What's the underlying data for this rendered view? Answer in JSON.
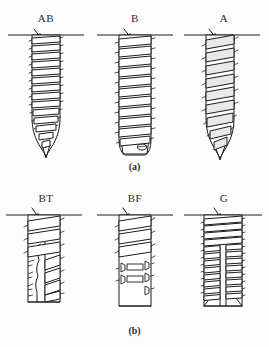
{
  "figure": {
    "title_alt": "Screw thread form comparison figure",
    "background_color": "#fdfdfd",
    "line_color": "#1c1c1c",
    "panels": [
      {
        "caption": "(a)",
        "items": [
          {
            "label": "AB",
            "name": "screw-ab",
            "description": "Tapered point self-tapping screw, type AB thread, narrow pitch",
            "thread_turns": 13,
            "tip": "pointed",
            "shank": "tapered"
          },
          {
            "label": "B",
            "name": "screw-b",
            "description": "Blunt point type B thread, wide crest, parallel shank",
            "thread_turns": 11,
            "tip": "blunt-flat",
            "shank": "parallel"
          },
          {
            "label": "A",
            "name": "screw-a",
            "description": "Coarse pitch type A thread with sharp gimlet point",
            "thread_turns": 9,
            "tip": "pointed",
            "shank": "tapered"
          }
        ]
      },
      {
        "caption": "(b)",
        "items": [
          {
            "label": "BT",
            "name": "screw-bt",
            "description": "Type BT thread with longitudinal cutting slot along shank",
            "thread_turns": 7,
            "tip": "flat",
            "shank": "parallel-slotted"
          },
          {
            "label": "BF",
            "name": "screw-bf",
            "description": "Type BF thread with rectangular cutting flutes on lower shank",
            "thread_turns": 6,
            "tip": "flat",
            "shank": "parallel-fluted"
          },
          {
            "label": "G",
            "name": "screw-g",
            "description": "Type G fine machine thread with central longitudinal flute",
            "thread_turns": 14,
            "tip": "flat",
            "shank": "parallel-slotted"
          }
        ]
      }
    ]
  }
}
